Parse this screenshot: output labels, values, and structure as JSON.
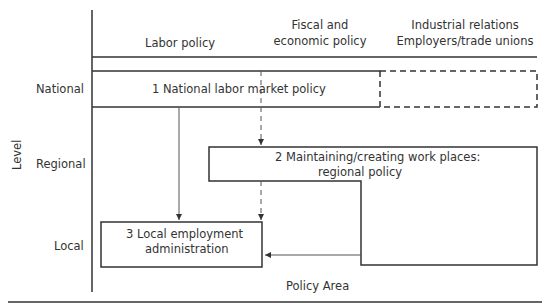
{
  "header": {
    "col_labor": "Labor policy",
    "col_fiscal_1": "Fiscal and",
    "col_fiscal_2": "economic policy",
    "col_industrial_1": "Industrial relations",
    "col_industrial_2": "Employers/trade unions"
  },
  "levels": {
    "axis_title": "Level",
    "national": "National",
    "regional": "Regional",
    "local": "Local"
  },
  "boxes": {
    "box1": "1  National labor market policy",
    "box2_line1": "2  Maintaining/creating work places:",
    "box2_line2": "regional policy",
    "box3_line1": "3  Local employment",
    "box3_line2": "administration"
  },
  "footer": {
    "x_axis_title": "Policy Area"
  },
  "colors": {
    "line": "#333333",
    "arrow": "#555555"
  }
}
